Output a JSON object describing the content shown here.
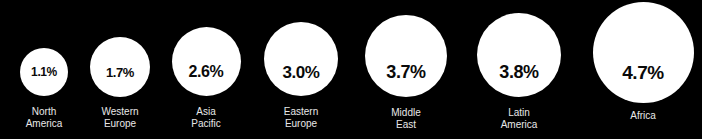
{
  "chart_data": {
    "type": "bar",
    "title": "",
    "subtitle": "",
    "xlabel": "",
    "ylabel": "",
    "legend": [],
    "grid": false,
    "unit": "%",
    "categories": [
      "North America",
      "Western Europe",
      "Asia Pacific",
      "Eastern Europe",
      "Middle East",
      "Latin America",
      "Africa"
    ],
    "values": [
      1.1,
      1.7,
      2.6,
      3.0,
      3.7,
      3.8,
      4.7
    ],
    "value_labels": [
      "1.1%",
      "1.7%",
      "2.6%",
      "3.0%",
      "3.7%",
      "3.8%",
      "4.7%"
    ],
    "ylim": [
      0,
      5
    ]
  },
  "colors": {
    "background": "#000000",
    "bubble": "#ffffff",
    "value_text": "#0a0a0a",
    "label_text": "#e8e8e8"
  },
  "bubbles": [
    {
      "value_label": "1.1%",
      "label": "North\nAmerica",
      "diameter": 48,
      "center_x": 44,
      "bottom_y": 96,
      "value_font_size": 12,
      "label_top": 106
    },
    {
      "value_label": "1.7%",
      "label": "Western\nEurope",
      "diameter": 60,
      "center_x": 120,
      "bottom_y": 97,
      "value_font_size": 13,
      "label_top": 106
    },
    {
      "value_label": "2.6%",
      "label": "Asia\nPacific",
      "diameter": 69,
      "center_x": 206,
      "bottom_y": 96,
      "value_font_size": 16,
      "label_top": 106
    },
    {
      "value_label": "3.0%",
      "label": "Eastern\nEurope",
      "diameter": 74,
      "center_x": 301,
      "bottom_y": 96,
      "value_font_size": 17,
      "label_top": 106
    },
    {
      "value_label": "3.7%",
      "label": "Middle\nEast",
      "diameter": 82,
      "center_x": 406,
      "bottom_y": 97,
      "value_font_size": 18,
      "label_top": 107
    },
    {
      "value_label": "3.8%",
      "label": "Latin\nAmerica",
      "diameter": 84,
      "center_x": 519,
      "bottom_y": 97,
      "value_font_size": 18,
      "label_top": 107
    },
    {
      "value_label": "4.7%",
      "label": "Africa",
      "diameter": 101,
      "center_x": 643,
      "bottom_y": 103,
      "value_font_size": 19,
      "label_top": 110
    }
  ]
}
